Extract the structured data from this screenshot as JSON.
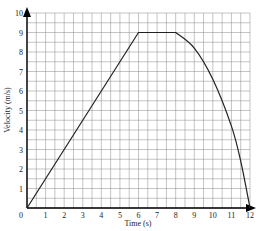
{
  "chart_data": {
    "type": "line",
    "title": "",
    "xlabel": "Time (s)",
    "ylabel": "Velocity (m/s)",
    "xlim": [
      0,
      12
    ],
    "ylim": [
      0,
      10
    ],
    "grid": true,
    "grid_minor_step": 0.5,
    "x_ticks": [
      "0",
      "1",
      "2",
      "3",
      "4",
      "5",
      "6",
      "7",
      "8",
      "9",
      "10",
      "11",
      "12"
    ],
    "y_ticks": [
      "1",
      "2",
      "3",
      "4",
      "5",
      "6",
      "7",
      "8",
      "9",
      "10"
    ],
    "series": [
      {
        "name": "velocity",
        "x": [
          0,
          6,
          8,
          9,
          10,
          11,
          11.5,
          12
        ],
        "y": [
          0,
          9,
          9,
          8.2,
          6.6,
          4.2,
          2.4,
          0
        ]
      }
    ],
    "colors": {
      "line": "#222222",
      "grid": "#888888",
      "axis": "#000000"
    }
  }
}
